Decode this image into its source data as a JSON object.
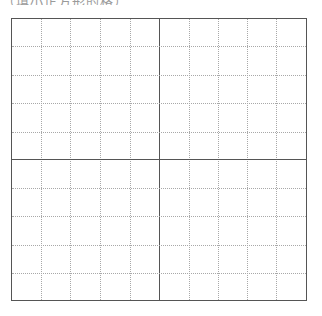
{
  "caption": {
    "text": "（填小正方形的格）"
  },
  "grid": {
    "columns": 10,
    "rows": 10,
    "major_divisions": 2,
    "line_color": "#555555",
    "minor_line_color": "#a8a8a8"
  }
}
